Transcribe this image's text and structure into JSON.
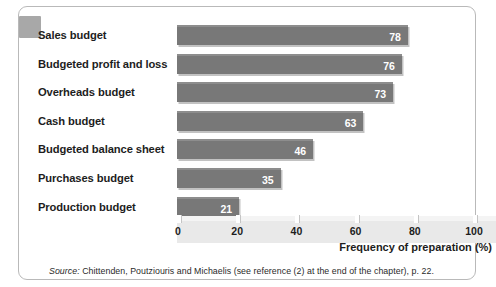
{
  "chart_data": {
    "type": "bar",
    "orientation": "horizontal",
    "title": "",
    "xlabel": "Frequency of preparation (%)",
    "ylabel": "",
    "xlim": [
      0,
      100
    ],
    "xticks": [
      0,
      20,
      40,
      60,
      80,
      100
    ],
    "xtick_labels": [
      "0",
      "20",
      "40",
      "60",
      "80",
      "100"
    ],
    "grid": false,
    "legend": false,
    "bar_color": "#787878",
    "value_label_color": "#ffffff",
    "categories": [
      "Sales budget",
      "Budgeted profit and loss",
      "Overheads budget",
      "Cash budget",
      "Budgeted balance sheet",
      "Purchases budget",
      "Production budget"
    ],
    "values": [
      78,
      76,
      73,
      63,
      46,
      35,
      21
    ],
    "value_labels": [
      "78",
      "76",
      "73",
      "63",
      "46",
      "35",
      "21"
    ]
  },
  "footnote": {
    "keyword": "Source:",
    "text": " Chittenden, Poutziouris and Michaelis (see reference (2) at the end of the chapter), p. 22."
  }
}
